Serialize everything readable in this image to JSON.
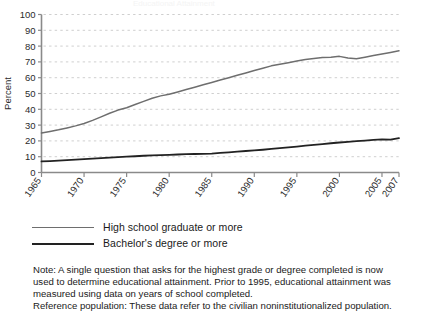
{
  "figure": {
    "title_faint": "Educational Attainment",
    "ylabel": "Percent",
    "xlabel": ""
  },
  "legend": {
    "items": [
      {
        "label": "High school graduate or more",
        "color": "#6e6e6e",
        "key": "hs"
      },
      {
        "label": "Bachelor's degree or more",
        "color": "#222222",
        "key": "ba"
      }
    ]
  },
  "notes": {
    "line1": "Note: A single question that asks for the highest grade or degree completed is now",
    "line2": "used to determine educational attainment. Prior to 1995, educational attainment was",
    "line3": "measured using data on years of school completed.",
    "line4": "Reference population: These data refer to the civilian noninstitutionalized population."
  },
  "axis": {
    "y_ticks": [
      "0",
      "10",
      "20",
      "30",
      "40",
      "50",
      "60",
      "70",
      "80",
      "90",
      "100"
    ],
    "x_ticks": [
      "1965",
      "1970",
      "1975",
      "1980",
      "1985",
      "1990",
      "1995",
      "2000",
      "2005",
      "2007"
    ]
  },
  "chart_data": {
    "type": "line",
    "title": "Educational Attainment",
    "xlabel": "",
    "ylabel": "Percent",
    "xlim": [
      1965,
      2007
    ],
    "ylim": [
      0,
      100
    ],
    "grid": true,
    "legend_position": "below",
    "x": [
      1965,
      1966,
      1967,
      1968,
      1969,
      1970,
      1971,
      1972,
      1973,
      1974,
      1975,
      1976,
      1977,
      1978,
      1979,
      1980,
      1981,
      1982,
      1983,
      1984,
      1985,
      1986,
      1987,
      1988,
      1989,
      1990,
      1991,
      1992,
      1993,
      1994,
      1995,
      1996,
      1997,
      1998,
      1999,
      2000,
      2001,
      2002,
      2003,
      2004,
      2005,
      2006,
      2007
    ],
    "series": [
      {
        "name": "High school graduate or more",
        "color": "#6e6e6e",
        "values": [
          25.0,
          26.0,
          27.0,
          28.2,
          29.5,
          31.0,
          33.0,
          35.2,
          37.5,
          39.5,
          41.0,
          43.0,
          45.0,
          47.0,
          48.5,
          49.5,
          51.0,
          52.5,
          54.0,
          55.5,
          57.0,
          58.5,
          60.0,
          61.5,
          63.0,
          64.5,
          66.0,
          67.5,
          68.5,
          69.5,
          70.5,
          71.5,
          72.2,
          72.8,
          73.0,
          73.5,
          72.5,
          72.0,
          73.0,
          74.0,
          75.0,
          76.0,
          77.0
        ]
      },
      {
        "name": "Bachelor's degree or more",
        "color": "#222222",
        "values": [
          7.0,
          7.2,
          7.5,
          7.8,
          8.1,
          8.5,
          8.8,
          9.1,
          9.4,
          9.7,
          10.0,
          10.3,
          10.6,
          10.8,
          11.0,
          11.2,
          11.4,
          11.6,
          11.7,
          11.8,
          12.0,
          12.4,
          12.8,
          13.2,
          13.6,
          14.0,
          14.4,
          14.9,
          15.4,
          15.9,
          16.4,
          17.0,
          17.5,
          18.0,
          18.5,
          19.0,
          19.4,
          19.8,
          20.2,
          20.6,
          21.0,
          20.8,
          21.8
        ]
      }
    ]
  }
}
